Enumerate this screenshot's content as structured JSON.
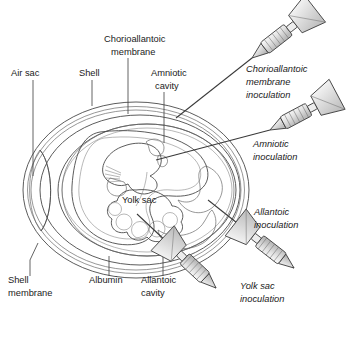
{
  "figure": {
    "palette": {
      "ink": "#1b1b1b",
      "line": "#4a4a4a",
      "shell_fill": "#ffffff",
      "albumin_fill": "#efefef",
      "allantoic_fill": "#c9c9c9",
      "amniotic_fill": "#e3e3e3",
      "yolk_fill": "#dcdcdc",
      "embryo_fill": "#cfcfcf",
      "syringe_fill": "#e6e6e6"
    }
  },
  "structure_labels": [
    {
      "id": "air-sac",
      "text": "Air sac",
      "x": 11,
      "y": 76,
      "align": "start"
    },
    {
      "id": "shell",
      "text": "Shell",
      "x": 79,
      "y": 76,
      "align": "start"
    },
    {
      "id": "chorioallantoic-membrane",
      "line1": "Chorioallantoic",
      "line2": "membrane",
      "x": 104,
      "y": 42,
      "align": "start"
    },
    {
      "id": "amniotic-cavity",
      "line1": "Amniotic",
      "line2": "cavity",
      "x": 151,
      "y": 76,
      "align": "start"
    },
    {
      "id": "yolk-sac",
      "text": "Yolk sac",
      "x": 122,
      "y": 203,
      "align": "start"
    },
    {
      "id": "shell-membrane",
      "line1": "Shell",
      "line2": "membrane",
      "x": 8,
      "y": 283,
      "align": "start"
    },
    {
      "id": "albumin",
      "text": "Albumin",
      "x": 89,
      "y": 283,
      "align": "start"
    },
    {
      "id": "allantoic-cavity",
      "line1": "Allantoic",
      "line2": "cavity",
      "x": 141,
      "y": 283,
      "align": "start"
    }
  ],
  "inoculation_routes": [
    {
      "id": "chorioallantoic-membrane-inoculation",
      "line1": "Chorioallantoic",
      "line2": "membrane",
      "line3": "inoculation",
      "x": 246,
      "y": 72
    },
    {
      "id": "amniotic-inoculation",
      "line1": "Amniotic",
      "line2": "inoculation",
      "line3": "",
      "x": 253,
      "y": 147
    },
    {
      "id": "allantoic-inoculation",
      "line1": "Allantoic",
      "line2": "inoculation",
      "line3": "",
      "x": 254,
      "y": 215
    },
    {
      "id": "yolk-sac-inoculation",
      "line1": "Yolk sac",
      "line2": "inoculation",
      "line3": "",
      "x": 240,
      "y": 289
    }
  ],
  "syringes": [
    {
      "id": "syringe-chorioallantoic",
      "target": "chorioallantoic membrane"
    },
    {
      "id": "syringe-amniotic",
      "target": "amniotic cavity"
    },
    {
      "id": "syringe-allantoic",
      "target": "allantoic cavity"
    },
    {
      "id": "syringe-yolk-sac",
      "target": "yolk sac"
    }
  ]
}
